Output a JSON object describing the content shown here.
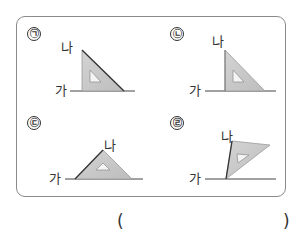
{
  "problem": {
    "panels": [
      {
        "marker": "㉠",
        "line_label": "가",
        "top_label": "나"
      },
      {
        "marker": "㉡",
        "line_label": "가",
        "top_label": "나"
      },
      {
        "marker": "㉢",
        "line_label": "가",
        "top_label": "나"
      },
      {
        "marker": "㉣",
        "line_label": "가",
        "top_label": "나"
      }
    ],
    "answer": {
      "open_paren": "(",
      "close_paren": ")",
      "value": ""
    }
  },
  "colors": {
    "triangle_fill": "#c8c8c8",
    "triangle_edge": "#999999",
    "dark_edge": "#333333",
    "line": "#444444",
    "border": "#8a8a8a"
  }
}
